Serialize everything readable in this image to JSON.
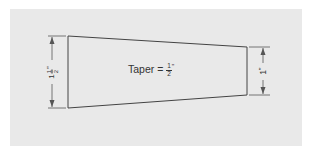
{
  "diagram": {
    "title_label": "Taper = ",
    "taper_fraction": {
      "numerator": "1",
      "denominator": "2",
      "unit": "\""
    },
    "left_dimension": {
      "whole": "1",
      "numerator": "1",
      "denominator": "2",
      "unit": "\""
    },
    "right_dimension": {
      "value": "1",
      "unit": "\""
    },
    "colors": {
      "background": "#e9e9e9",
      "line": "#444444",
      "text": "#333333"
    }
  }
}
